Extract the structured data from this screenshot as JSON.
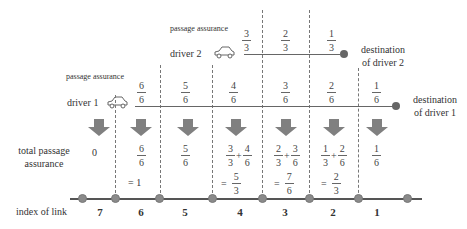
{
  "labels": {
    "passage_assurance_1": "passage assurance",
    "passage_assurance_2": "passage assurance",
    "driver1": "driver 1",
    "driver2": "driver 2",
    "dest_driver2_line1": "destination",
    "dest_driver2_line2": "of driver 2",
    "dest_driver1_line1": "destination",
    "dest_driver1_line2": "of driver 1",
    "total_line1": "total passage",
    "total_line2": "assurance",
    "index_of_link": "index of link"
  },
  "driver1_assurance": [
    {
      "num": "6",
      "den": "6"
    },
    {
      "num": "5",
      "den": "6"
    },
    {
      "num": "4",
      "den": "6"
    },
    {
      "num": "3",
      "den": "6"
    },
    {
      "num": "2",
      "den": "6"
    },
    {
      "num": "1",
      "den": "6"
    }
  ],
  "driver2_assurance": [
    {
      "num": "3",
      "den": "3"
    },
    {
      "num": "2",
      "den": "3"
    },
    {
      "num": "1",
      "den": "3"
    }
  ],
  "totals": {
    "link7": "0",
    "link6": {
      "num": "6",
      "den": "6",
      "eq": "= 1"
    },
    "link5": {
      "num": "5",
      "den": "6"
    },
    "link4": {
      "a_num": "3",
      "a_den": "3",
      "op": "+",
      "b_num": "4",
      "b_den": "6",
      "eq": "=",
      "r_num": "5",
      "r_den": "3"
    },
    "link3": {
      "a_num": "2",
      "a_den": "3",
      "op": "+",
      "b_num": "3",
      "b_den": "6",
      "eq": "=",
      "r_num": "7",
      "r_den": "6"
    },
    "link2": {
      "a_num": "1",
      "a_den": "3",
      "op": "+",
      "b_num": "2",
      "b_den": "6",
      "eq": "=",
      "r_num": "2",
      "r_den": "3"
    },
    "link1": {
      "num": "1",
      "den": "6"
    }
  },
  "link_indices": [
    "7",
    "6",
    "5",
    "4",
    "3",
    "2",
    "1"
  ],
  "icons": [
    "car-icon",
    "down-arrow-icon",
    "node-icon",
    "destination-icon"
  ],
  "colors": {
    "arrow": "#808080",
    "node": "#8a8a8a",
    "line": "#555555"
  }
}
